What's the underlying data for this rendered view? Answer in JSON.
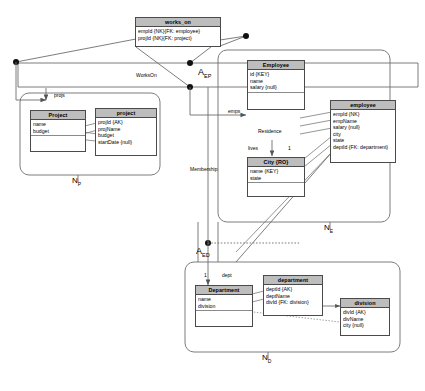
{
  "diagram": {
    "title_note": "ER to relational schema mapping diagram",
    "colors": {
      "header_fill": "#bdbdbd",
      "box_stroke": "#4a4a4a",
      "line": "#6e6e6e",
      "node": "#111111"
    }
  },
  "relationship_boxes": [
    {
      "id": "works_on",
      "name": "works_on",
      "attrs": [
        "empId {NK}{FK: employee}",
        "projId {NK}{FK: project}"
      ]
    }
  ],
  "entities": [
    {
      "id": "project_ent",
      "name": "Project",
      "attrs": [
        "name",
        "budget"
      ]
    },
    {
      "id": "employee_ent",
      "name": "Employee",
      "attrs": [
        "id {KEY}",
        "name",
        "salary {null}"
      ]
    },
    {
      "id": "city_ent",
      "name": "City {RO}",
      "attrs": [
        "name {KEY}",
        "state"
      ]
    },
    {
      "id": "department_ent",
      "name": "Department",
      "attrs": [
        "name",
        "division"
      ]
    }
  ],
  "tables": [
    {
      "id": "project_tbl",
      "name": "project",
      "attrs": [
        "projId {AK}",
        "projName",
        "budget",
        "startDate {null}"
      ]
    },
    {
      "id": "employee_tbl",
      "name": "employee",
      "attrs": [
        "empId {NK}",
        "empName",
        "salary {null}",
        "city",
        "state",
        "deptId {FK: department}"
      ]
    },
    {
      "id": "department_tbl",
      "name": "department",
      "attrs": [
        "deptId {AK}",
        "deptName",
        "divId {FK: division}"
      ]
    },
    {
      "id": "division_tbl",
      "name": "division",
      "attrs": [
        "divId {AK}",
        "divName",
        "city {null}"
      ]
    }
  ],
  "edge_labels": {
    "works_on_rel": "WorksOn",
    "projs": "projs",
    "emps": "emps",
    "residence": "Residence",
    "lives": "lives",
    "membership": "Membership",
    "dept": "dept"
  },
  "cardinalities": {
    "lives": "1",
    "dept": "1"
  },
  "region_labels": {
    "n_p": "N",
    "n_p_sub": "P",
    "n_e": "N",
    "n_e_sub": "E",
    "n_d": "N",
    "n_d_sub": "D",
    "a_ep": "A",
    "a_ep_sub": "EP",
    "a_ed": "A",
    "a_ed_sub": "ED"
  }
}
